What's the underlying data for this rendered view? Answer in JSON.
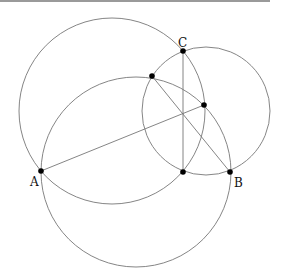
{
  "figure": {
    "width": 281,
    "height": 279,
    "stroke_color": "#777777",
    "point_color": "#000000",
    "circles": [
      {
        "name": "circle-upper-left",
        "cx": 112,
        "cy": 111,
        "r": 93
      },
      {
        "name": "circle-lower",
        "cx": 136,
        "cy": 172,
        "r": 95
      },
      {
        "name": "circle-right",
        "cx": 206,
        "cy": 111,
        "r": 64
      }
    ],
    "points": [
      {
        "name": "A",
        "label": "A",
        "x": 41,
        "y": 171,
        "lx": 30,
        "ly": 186
      },
      {
        "name": "B",
        "label": "B",
        "x": 230,
        "y": 172,
        "lx": 234,
        "ly": 187
      },
      {
        "name": "C",
        "label": "C",
        "x": 183,
        "y": 51,
        "lx": 178,
        "ly": 47
      },
      {
        "name": "P1",
        "label": "",
        "x": 152,
        "y": 76
      },
      {
        "name": "P2",
        "label": "",
        "x": 204,
        "y": 105
      },
      {
        "name": "P3",
        "label": "",
        "x": 183,
        "y": 172
      }
    ],
    "segments": [
      {
        "name": "segment-A-P2",
        "x1": 41,
        "y1": 171,
        "x2": 204,
        "y2": 105
      },
      {
        "name": "segment-C-P3",
        "x1": 183,
        "y1": 51,
        "x2": 183,
        "y2": 172
      },
      {
        "name": "segment-P1-B",
        "x1": 152,
        "y1": 76,
        "x2": 230,
        "y2": 172
      }
    ]
  },
  "labels": {
    "A": "A",
    "B": "B",
    "C": "C"
  }
}
